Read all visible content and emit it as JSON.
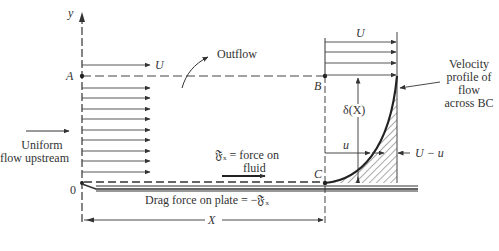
{
  "diagram": {
    "type": "boundary-layer control volume",
    "axis": {
      "y_label": "y",
      "origin_label": "0"
    },
    "points": {
      "A": "A",
      "B": "B",
      "C": "C"
    },
    "labels": {
      "freestream_U_left": "U",
      "freestream_U_right": "U",
      "outflow": "Outflow",
      "uniform_flow_line1": "Uniform",
      "uniform_flow_line2": "flow upstream",
      "force_line1": "𝔉ₓ = force on",
      "force_line2": "fluid",
      "drag": "Drag force on plate = −𝔉ₓ",
      "velocity_profile_line1": "Velocity",
      "velocity_profile_line2": "profile of",
      "velocity_profile_line3": "flow",
      "velocity_profile_line4": "across BC",
      "delta": "δ(X)",
      "u": "u",
      "U_minus_u": "U − u",
      "X": "X"
    },
    "colors": {
      "line": "#333333",
      "dashed": "#444444",
      "hatch": "#555555",
      "background": "#ffffff"
    }
  }
}
